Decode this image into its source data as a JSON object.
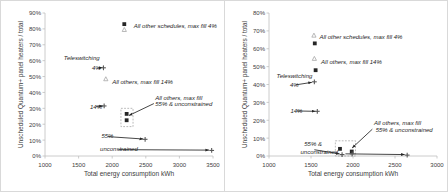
{
  "figure": {
    "background": "#ffffff",
    "frame_color": "#d9d9d9",
    "axis_color": "#bfbfbf",
    "text_color": "#404040",
    "marker_color_square": "#262626",
    "marker_color_plus": "#595959",
    "marker_color_triangle": "#a6a6a6"
  },
  "charts": [
    {
      "id": "chart-left",
      "chart_data": {
        "type": "scatter",
        "title": "",
        "xlabel": "Total energy consumption   kWh",
        "ylabel": "Unscheduled Quantum+ panel heaters / total",
        "xlim": [
          1000,
          3500
        ],
        "ylim": [
          0,
          0.9
        ],
        "xticks": [
          1000,
          1500,
          2000,
          2500,
          3000,
          3500
        ],
        "xticklabels": [
          "1000",
          "1500",
          "2000",
          "2500",
          "3000",
          "3500"
        ],
        "yticks": [
          0,
          0.1,
          0.2,
          0.3,
          0.4,
          0.5,
          0.6,
          0.7,
          0.8,
          0.9
        ],
        "yticklabels": [
          "0%",
          "10%",
          "20%",
          "30%",
          "40%",
          "50%",
          "60%",
          "70%",
          "80%",
          "90%"
        ],
        "grid": false,
        "legend": "none",
        "series": [
          {
            "name": "all other schedules max fill 4%",
            "marker": "square",
            "points": [
              [
                2180,
                0.83
              ]
            ]
          },
          {
            "name": "all other schedules max fill 4% upper",
            "marker": "triangle",
            "points": [
              [
                2180,
                0.795
              ]
            ]
          },
          {
            "name": "teleswitching 4%",
            "marker": "plus",
            "points": [
              [
                1870,
                0.555
              ]
            ]
          },
          {
            "name": "all others max fill 14%",
            "marker": "triangle",
            "points": [
              [
                1905,
                0.485
              ]
            ]
          },
          {
            "name": "teleswitching 14%",
            "marker": "plus",
            "points": [
              [
                1880,
                0.315
              ]
            ]
          },
          {
            "name": "max fill 55% cluster square",
            "marker": "square",
            "points": [
              [
                2215,
                0.265
              ],
              [
                2215,
                0.225
              ]
            ]
          },
          {
            "name": "unconstrained 55%",
            "marker": "plus",
            "points": [
              [
                2490,
                0.105
              ]
            ]
          },
          {
            "name": "unconstrained",
            "marker": "plus",
            "points": [
              [
                3480,
                0.035
              ]
            ]
          }
        ],
        "annotations": [
          {
            "text": "All other schedules, max fill 4%",
            "x": 2320,
            "y": 0.82
          },
          {
            "text": "Teleswitching",
            "x": 1280,
            "y": 0.615
          },
          {
            "text": "4%",
            "x": 1700,
            "y": 0.555
          },
          {
            "text": "All others, max fill 14%",
            "x": 2000,
            "y": 0.465
          },
          {
            "text": "All others, max fill",
            "x": 2640,
            "y": 0.365
          },
          {
            "text": "55% & unconstrained",
            "x": 2640,
            "y": 0.325
          },
          {
            "text": "14%",
            "x": 1670,
            "y": 0.31
          },
          {
            "text": "55%",
            "x": 1840,
            "y": 0.125
          },
          {
            "text": "unconstrained",
            "x": 1820,
            "y": 0.045
          }
        ],
        "arrows": [
          {
            "x1": 1780,
            "y1": 0.552,
            "x2": 1855,
            "y2": 0.558
          },
          {
            "x1": 2620,
            "y1": 0.33,
            "x2": 2250,
            "y2": 0.255
          },
          {
            "x1": 1760,
            "y1": 0.312,
            "x2": 1860,
            "y2": 0.315
          },
          {
            "x1": 1935,
            "y1": 0.122,
            "x2": 2460,
            "y2": 0.107
          },
          {
            "x1": 2100,
            "y1": 0.04,
            "x2": 3440,
            "y2": 0.037
          }
        ],
        "dashed_box": {
          "x": 2130,
          "y": 0.185,
          "w": 180,
          "h": 0.115
        }
      }
    },
    {
      "id": "chart-right",
      "chart_data": {
        "type": "scatter",
        "title": "",
        "xlabel": "Total energy consumption   kWh",
        "ylabel": "Unscheduled Quantum+ panel heaters / total",
        "xlim": [
          1000,
          3000
        ],
        "ylim": [
          0,
          0.8
        ],
        "xticks": [
          1000,
          1500,
          2000,
          2500,
          3000
        ],
        "xticklabels": [
          "1000",
          "1500",
          "2000",
          "2500",
          "3000"
        ],
        "yticks": [
          0,
          0.1,
          0.2,
          0.3,
          0.4,
          0.5,
          0.6,
          0.7,
          0.8
        ],
        "yticklabels": [
          "0%",
          "10%",
          "20%",
          "30%",
          "40%",
          "50%",
          "60%",
          "70%",
          "80%"
        ],
        "grid": false,
        "legend": "none",
        "series": [
          {
            "name": "all other schedules max fill 4%",
            "marker": "square",
            "points": [
              [
                1545,
                0.63
              ]
            ]
          },
          {
            "name": "all other schedules max fill 4% upper",
            "marker": "triangle",
            "points": [
              [
                1535,
                0.675
              ]
            ]
          },
          {
            "name": "all others max fill 14% square",
            "marker": "square",
            "points": [
              [
                1555,
                0.48
              ]
            ]
          },
          {
            "name": "all others max fill 14% triangle",
            "marker": "triangle",
            "points": [
              [
                1540,
                0.545
              ]
            ]
          },
          {
            "name": "teleswitching 4%",
            "marker": "plus",
            "points": [
              [
                1540,
                0.415
              ]
            ]
          },
          {
            "name": "teleswitching 14%",
            "marker": "plus",
            "points": [
              [
                1575,
                0.25
              ]
            ]
          },
          {
            "name": "max fill 55% square",
            "marker": "square",
            "points": [
              [
                1845,
                0.04
              ],
              [
                1985,
                0.025
              ]
            ]
          },
          {
            "name": "unconstrained low",
            "marker": "plus",
            "points": [
              [
                1870,
                0.008
              ],
              [
                1990,
                0.012
              ],
              [
                2645,
                0.005
              ]
            ]
          }
        ],
        "annotations": [
          {
            "text": "All other schedules, max fill 4%",
            "x": 1600,
            "y": 0.665
          },
          {
            "text": "All others, max fill 14%",
            "x": 1620,
            "y": 0.525
          },
          {
            "text": "Teleswitching",
            "x": 1090,
            "y": 0.445
          },
          {
            "text": "4%",
            "x": 1250,
            "y": 0.4
          },
          {
            "text": "14%",
            "x": 1255,
            "y": 0.252
          },
          {
            "text": "All others, max fill",
            "x": 2250,
            "y": 0.185
          },
          {
            "text": "55% & unconstrained",
            "x": 2270,
            "y": 0.145
          },
          {
            "text": "55% &",
            "x": 1420,
            "y": 0.065
          },
          {
            "text": "unconstrained",
            "x": 1375,
            "y": 0.025
          }
        ],
        "arrows": [
          {
            "x1": 1320,
            "y1": 0.398,
            "x2": 1510,
            "y2": 0.412
          },
          {
            "x1": 1330,
            "y1": 0.252,
            "x2": 1552,
            "y2": 0.25
          },
          {
            "x1": 2230,
            "y1": 0.15,
            "x2": 1990,
            "y2": 0.045
          },
          {
            "x1": 1540,
            "y1": 0.035,
            "x2": 1840,
            "y2": 0.012
          },
          {
            "x1": 1910,
            "y1": 0.012,
            "x2": 2615,
            "y2": 0.008
          }
        ],
        "dashed_box": {
          "x": 1790,
          "y": 0.0,
          "w": 240,
          "h": 0.085
        }
      }
    }
  ]
}
